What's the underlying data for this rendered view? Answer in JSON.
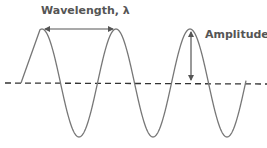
{
  "diagram": {
    "labels": {
      "wavelength": "Wavelength, λ",
      "amplitude": "Amplitude"
    },
    "colors": {
      "wave": "#777777",
      "axis": "#333333",
      "arrow": "#555555",
      "text": "#555555",
      "background": "#ffffff"
    },
    "wave": {
      "cycles_shown": 3,
      "start_phase": "rising from equilibrium"
    }
  }
}
